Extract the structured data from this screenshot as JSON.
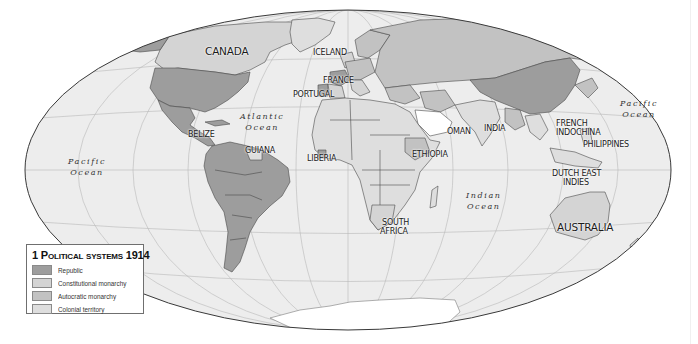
{
  "map": {
    "title_number": "1",
    "title_text": "Political systems 1914",
    "projection": "world-ellipse",
    "colors": {
      "republic": "#9d9d9d",
      "constitutional_monarchy": "#d4d4d4",
      "autocratic_monarchy": "#c2c2c2",
      "colonial_territory": "#dedede",
      "ocean": "#ededed",
      "antarctica": "#ffffff",
      "graticule": "#b9b9b9",
      "border": "#4a4a4a",
      "outline": "#3a3a3a"
    }
  },
  "legend": {
    "title_number": "1",
    "title_text": "Political systems 1914",
    "items": [
      {
        "label": "Republic",
        "color": "#9d9d9d"
      },
      {
        "label": "Constitutional monarchy",
        "color": "#d4d4d4"
      },
      {
        "label": "Autocratic monarchy",
        "color": "#c2c2c2"
      },
      {
        "label": "Colonial territory",
        "color": "#dedede"
      }
    ]
  },
  "country_labels": [
    {
      "name": "CANADA",
      "x": 205,
      "y": 46,
      "size": "big"
    },
    {
      "name": "ICELAND",
      "x": 313,
      "y": 48
    },
    {
      "name": "FRANCE",
      "x": 323,
      "y": 77
    },
    {
      "name": "PORTUGAL",
      "x": 295,
      "y": 90
    },
    {
      "name": "BELIZE",
      "x": 188,
      "y": 131
    },
    {
      "name": "GUIANA",
      "x": 245,
      "y": 148
    },
    {
      "name": "LIBERIA",
      "x": 307,
      "y": 155
    },
    {
      "name": "OMAN",
      "x": 448,
      "y": 128
    },
    {
      "name": "INDIA",
      "x": 484,
      "y": 125
    },
    {
      "name": "ETHIOPIA",
      "x": 412,
      "y": 150
    },
    {
      "name": "FRENCH",
      "x": 556,
      "y": 120
    },
    {
      "name": "INDOCHINA",
      "x": 556,
      "y": 129
    },
    {
      "name": "PHILIPPINES",
      "x": 583,
      "y": 141
    },
    {
      "name": "DUTCH EAST",
      "x": 552,
      "y": 170
    },
    {
      "name": "INDIES",
      "x": 563,
      "y": 179
    },
    {
      "name": "SOUTH",
      "x": 382,
      "y": 219
    },
    {
      "name": "AFRICA",
      "x": 380,
      "y": 228
    },
    {
      "name": "AUSTRALIA",
      "x": 557,
      "y": 223,
      "size": "big"
    }
  ],
  "ocean_labels": [
    {
      "line1": "Pacific",
      "line2": "Ocean",
      "x": 68,
      "y": 156
    },
    {
      "line1": "Atlantic",
      "line2": "Ocean",
      "x": 240,
      "y": 112
    },
    {
      "line1": "Indian",
      "line2": "Ocean",
      "x": 465,
      "y": 190
    },
    {
      "line1": "Pacific",
      "line2": "Ocean",
      "x": 620,
      "y": 98
    }
  ]
}
